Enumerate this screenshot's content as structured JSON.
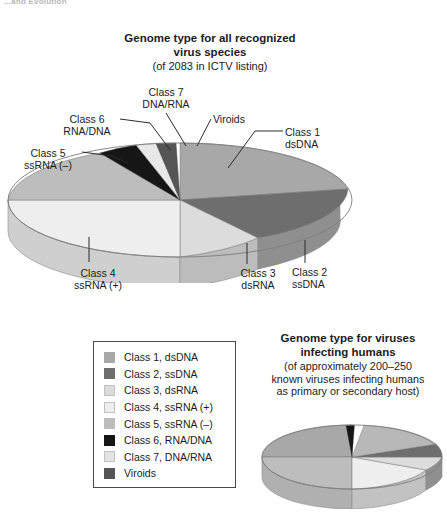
{
  "running_head": "...and Evolution",
  "main_chart": {
    "title": "Genome type for all recognized\nvirus species",
    "subtitle": "(of 2083 in ICTV listing)",
    "callouts": {
      "class7": "Class 7\nDNA/RNA",
      "class6": "Class 6\nRNA/DNA",
      "class5": "Class 5\nssRNA (–)",
      "viroids": "Viroids",
      "class1": "Class 1\ndsDNA",
      "class2": "Class 2\nssDNA",
      "class3": "Class 3\ndsRNA",
      "class4": "Class 4\nssRNA (+)"
    }
  },
  "legend": {
    "items": [
      {
        "label": "Class 1, dsDNA",
        "color": "#a8a8a8"
      },
      {
        "label": "Class 2, ssDNA",
        "color": "#6e6e6e"
      },
      {
        "label": "Class 3, dsRNA",
        "color": "#dcdcdc"
      },
      {
        "label": "Class 4, ssRNA (+)",
        "color": "#eeeeee"
      },
      {
        "label": "Class 5, ssRNA (–)",
        "color": "#bdbdbd"
      },
      {
        "label": "Class 6, RNA/DNA",
        "color": "#161616"
      },
      {
        "label": "Class 7, DNA/RNA",
        "color": "#e4e4e4"
      },
      {
        "label": "Viroids",
        "color": "#555555"
      }
    ]
  },
  "secondary_chart": {
    "title": "Genome type for viruses\ninfecting humans",
    "subtitle": "(of approximately 200–250\nknown viruses infecting humans\nas primary or secondary host)"
  },
  "chart_data": [
    {
      "type": "pie",
      "id": "all-virus-species",
      "title": "Genome type for all recognized virus species",
      "subtitle": "(of 2083 in ICTV listing)",
      "total": 2083,
      "units": "virus species",
      "legend_position": "below-left",
      "labels": [
        "Class 1, dsDNA",
        "Class 2, ssDNA",
        "Class 3, dsRNA",
        "Class 4, ssRNA (+)",
        "Class 5, ssRNA (–)",
        "Class 6, RNA/DNA",
        "Class 7, DNA/RNA",
        "Viroids"
      ],
      "values": [
        24.0,
        11.5,
        9.0,
        31.0,
        17.5,
        3.0,
        2.0,
        2.0
      ],
      "value_unit": "percent",
      "colors": [
        "#a8a8a8",
        "#6e6e6e",
        "#dcdcdc",
        "#eeeeee",
        "#bdbdbd",
        "#161616",
        "#e4e4e4",
        "#555555"
      ]
    },
    {
      "type": "pie",
      "id": "viruses-infecting-humans",
      "title": "Genome type for viruses infecting humans",
      "subtitle": "(of approximately 200–250 known viruses infecting humans as primary or secondary host)",
      "total": "200–250",
      "units": "viruses",
      "legend_position": "shared",
      "labels": [
        "Class 1, dsDNA",
        "Class 2, ssDNA",
        "Class 3, dsRNA",
        "Class 4, ssRNA (+)",
        "Class 5, ssRNA (–)",
        "Class 6, RNA/DNA"
      ],
      "values": [
        30.0,
        6.0,
        9.0,
        29.0,
        22.0,
        4.0
      ],
      "value_unit": "percent",
      "colors": [
        "#a8a8a8",
        "#6e6e6e",
        "#dcdcdc",
        "#eeeeee",
        "#bdbdbd",
        "#161616"
      ]
    }
  ]
}
